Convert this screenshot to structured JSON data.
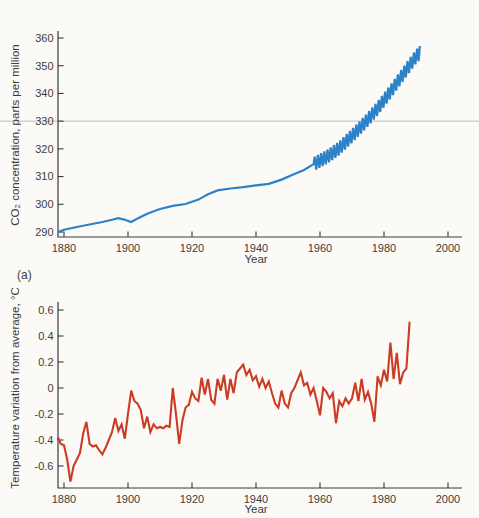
{
  "page": {
    "panel_label": "(a)",
    "background_color": "#fbfaf6",
    "axis_color": "#3a3a3a"
  },
  "chart_data": [
    {
      "type": "line",
      "name": "co2-concentration-chart",
      "title": "",
      "xlabel": "Year",
      "ylabel": "CO₂ concentration, parts per million",
      "line_color": "#2b82c8",
      "grid": false,
      "legend": "none",
      "xlim": [
        1877,
        2004
      ],
      "ylim": [
        288,
        362
      ],
      "x_ticks": [
        1880,
        1900,
        1920,
        1940,
        1960,
        1980,
        2000
      ],
      "y_ticks": [
        290,
        300,
        310,
        320,
        330,
        340,
        350,
        360
      ],
      "refline": {
        "value": 330,
        "color": "#c9c8c4"
      },
      "annual_mean": [
        [
          1877.8,
          290.0
        ],
        [
          1880,
          290.8
        ],
        [
          1884,
          291.8
        ],
        [
          1888,
          292.7
        ],
        [
          1892,
          293.6
        ],
        [
          1895,
          294.4
        ],
        [
          1897,
          295.0
        ],
        [
          1899,
          294.4
        ],
        [
          1901,
          293.6
        ],
        [
          1903,
          294.9
        ],
        [
          1906,
          296.6
        ],
        [
          1910,
          298.3
        ],
        [
          1914,
          299.4
        ],
        [
          1918,
          300.1
        ],
        [
          1922,
          301.7
        ],
        [
          1925,
          303.6
        ],
        [
          1928,
          305.0
        ],
        [
          1932,
          305.7
        ],
        [
          1936,
          306.2
        ],
        [
          1940,
          306.8
        ],
        [
          1944,
          307.4
        ],
        [
          1948,
          308.9
        ],
        [
          1952,
          310.9
        ],
        [
          1955,
          312.4
        ],
        [
          1958,
          314.5
        ],
        [
          1962,
          317.0
        ],
        [
          1966,
          320.2
        ],
        [
          1970,
          324.7
        ],
        [
          1974,
          329.4
        ],
        [
          1978,
          334.6
        ],
        [
          1982,
          340.6
        ],
        [
          1986,
          347.0
        ],
        [
          1990,
          353.3
        ],
        [
          1991.2,
          354.6
        ]
      ],
      "seasonal_zigzag": {
        "start_year": 1958,
        "end_year": 1991.2,
        "amplitude_ppm": 2.5
      }
    },
    {
      "type": "line",
      "name": "temperature-variation-chart",
      "title": "",
      "xlabel": "Year",
      "ylabel": "Temperature variation from average, °C",
      "line_color": "#cc3b24",
      "grid": false,
      "legend": "none",
      "xlim": [
        1877,
        2004
      ],
      "ylim": [
        -0.8,
        0.65
      ],
      "x_ticks": [
        1880,
        1900,
        1920,
        1940,
        1960,
        1980,
        2000
      ],
      "y_ticks": [
        0.6,
        0.4,
        0.2,
        0,
        -0.2,
        -0.4,
        -0.6
      ],
      "y_tick_labels": [
        "0.6",
        "0.4",
        "0.2",
        "0",
        "-0.2",
        "-0.4",
        "-0.6"
      ],
      "start_year": 1877,
      "values": [
        -0.4,
        -0.38,
        -0.43,
        -0.44,
        -0.55,
        -0.72,
        -0.6,
        -0.55,
        -0.5,
        -0.35,
        -0.26,
        -0.43,
        -0.45,
        -0.44,
        -0.48,
        -0.51,
        -0.46,
        -0.4,
        -0.34,
        -0.23,
        -0.33,
        -0.28,
        -0.39,
        -0.2,
        -0.02,
        -0.1,
        -0.12,
        -0.17,
        -0.31,
        -0.22,
        -0.34,
        -0.28,
        -0.31,
        -0.3,
        -0.31,
        -0.29,
        -0.3,
        0.0,
        -0.2,
        -0.43,
        -0.25,
        -0.15,
        -0.13,
        -0.03,
        -0.08,
        -0.1,
        0.08,
        -0.05,
        0.07,
        -0.09,
        -0.12,
        0.07,
        -0.02,
        0.1,
        -0.09,
        0.07,
        -0.04,
        0.12,
        0.15,
        0.18,
        0.1,
        0.14,
        0.06,
        0.09,
        0.01,
        0.07,
        0.0,
        0.05,
        -0.04,
        -0.12,
        -0.15,
        -0.02,
        -0.12,
        -0.15,
        -0.04,
        0.0,
        0.06,
        0.12,
        0.02,
        0.04,
        -0.05,
        0.0,
        -0.1,
        -0.21,
        0.0,
        -0.03,
        -0.08,
        -0.04,
        -0.27,
        -0.1,
        -0.14,
        -0.08,
        -0.12,
        -0.08,
        0.04,
        -0.1,
        0.07,
        -0.09,
        -0.03,
        -0.12,
        -0.26,
        0.09,
        0.02,
        0.14,
        0.05,
        0.35,
        0.07,
        0.27,
        0.03,
        0.12,
        0.15,
        0.51
      ]
    }
  ]
}
